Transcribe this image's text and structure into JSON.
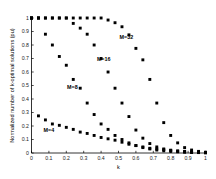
{
  "chart_data": {
    "type": "scatter",
    "title": "",
    "xlabel": "k",
    "ylabel": "Normalized number of k-optimal solutions (pu)",
    "xlim": [
      0,
      1
    ],
    "ylim": [
      0,
      1
    ],
    "grid": false,
    "legend_position": "inline-annotations",
    "xticks": [
      "0",
      "0.1",
      "0.2",
      "0.3",
      "0.4",
      "0.5",
      "0.6",
      "0.7",
      "0.8",
      "0.9",
      "1"
    ],
    "xtick_values": [
      0,
      0.1,
      0.2,
      0.3,
      0.4,
      0.5,
      0.6,
      0.7,
      0.8,
      0.9,
      1
    ],
    "yticks": [
      "0",
      "0.1",
      "0.2",
      "0.3",
      "0.4",
      "0.5",
      "0.6",
      "0.7",
      "0.8",
      "0.9",
      "1"
    ],
    "ytick_values": [
      0,
      0.1,
      0.2,
      0.3,
      0.4,
      0.5,
      0.6,
      0.7,
      0.8,
      0.9,
      1
    ],
    "marker": "filled-square",
    "color": "#000000",
    "series": [
      {
        "name": "M=4",
        "label": "M=4",
        "label_x": 0.1,
        "label_y": 0.155,
        "x": [
          0.0,
          0.04,
          0.08,
          0.12,
          0.16,
          0.2,
          0.24,
          0.28,
          0.32,
          0.36,
          0.4,
          0.44,
          0.48,
          0.52,
          0.56,
          0.6,
          0.64,
          0.68,
          0.72,
          0.76,
          0.8,
          0.84,
          0.88,
          0.92,
          0.96,
          1.0
        ],
        "y": [
          1.0,
          0.275,
          0.245,
          0.215,
          0.205,
          0.19,
          0.175,
          0.155,
          0.145,
          0.13,
          0.115,
          0.105,
          0.095,
          0.08,
          0.065,
          0.055,
          0.045,
          0.035,
          0.03,
          0.025,
          0.02,
          0.015,
          0.012,
          0.008,
          0.005,
          0.003
        ]
      },
      {
        "name": "M=8",
        "label": "M=8",
        "label_x": 0.235,
        "label_y": 0.475,
        "x": [
          0.0,
          0.04,
          0.08,
          0.12,
          0.16,
          0.2,
          0.24,
          0.28,
          0.32,
          0.36,
          0.4,
          0.44,
          0.48,
          0.52,
          0.56,
          0.6,
          0.64,
          0.68,
          0.72,
          0.76,
          0.8,
          0.84,
          0.88,
          0.92,
          0.96,
          1.0
        ],
        "y": [
          1.0,
          1.0,
          0.88,
          0.8,
          0.715,
          0.65,
          0.545,
          0.48,
          0.37,
          0.285,
          0.215,
          0.175,
          0.13,
          0.1,
          0.075,
          0.055,
          0.04,
          0.03,
          0.022,
          0.016,
          0.012,
          0.009,
          0.006,
          0.004,
          0.003,
          0.002
        ]
      },
      {
        "name": "M=16",
        "label": "M=16",
        "label_x": 0.415,
        "label_y": 0.685,
        "x": [
          0.0,
          0.04,
          0.08,
          0.12,
          0.16,
          0.2,
          0.24,
          0.28,
          0.32,
          0.36,
          0.4,
          0.44,
          0.48,
          0.52,
          0.56,
          0.6,
          0.64,
          0.68,
          0.72,
          0.76,
          0.8,
          0.84,
          0.88,
          0.92,
          0.96,
          1.0
        ],
        "y": [
          1.0,
          1.0,
          1.0,
          1.0,
          1.0,
          1.0,
          0.96,
          0.925,
          0.88,
          0.8,
          0.7,
          0.6,
          0.48,
          0.37,
          0.27,
          0.17,
          0.11,
          0.07,
          0.045,
          0.03,
          0.02,
          0.014,
          0.009,
          0.006,
          0.004,
          0.002
        ]
      },
      {
        "name": "M=32",
        "label": "M=32",
        "label_x": 0.545,
        "label_y": 0.845,
        "x": [
          0.0,
          0.04,
          0.08,
          0.12,
          0.16,
          0.2,
          0.24,
          0.28,
          0.32,
          0.36,
          0.4,
          0.44,
          0.48,
          0.52,
          0.56,
          0.6,
          0.64,
          0.68,
          0.72,
          0.76,
          0.8,
          0.84,
          0.88,
          0.92,
          0.96,
          1.0
        ],
        "y": [
          1.0,
          1.0,
          1.0,
          1.0,
          1.0,
          1.0,
          1.0,
          1.0,
          1.0,
          1.0,
          1.0,
          0.985,
          0.965,
          0.935,
          0.875,
          0.775,
          0.69,
          0.545,
          0.37,
          0.225,
          0.13,
          0.075,
          0.04,
          0.022,
          0.012,
          0.006
        ]
      }
    ]
  }
}
